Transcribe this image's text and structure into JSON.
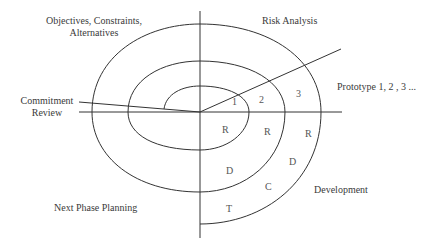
{
  "diagram": {
    "type": "spiral-model",
    "quadrants": {
      "top_left": {
        "line1": "Objectives, Constraints,",
        "line2": "Alternatives"
      },
      "top_right": "Risk Analysis",
      "bottom_left": "Next Phase Planning",
      "bottom_right": "Development"
    },
    "side_labels": {
      "left": {
        "line1": "Commitment",
        "line2": "Review"
      },
      "right": "Prototype 1, 2 , 3 ..."
    },
    "prototype_numbers": [
      "1",
      "2",
      "3"
    ],
    "loop_letters": {
      "inner": [
        "R"
      ],
      "middle": [
        "R",
        "D"
      ],
      "outer": [
        "R",
        "D",
        "C",
        "T"
      ]
    }
  }
}
